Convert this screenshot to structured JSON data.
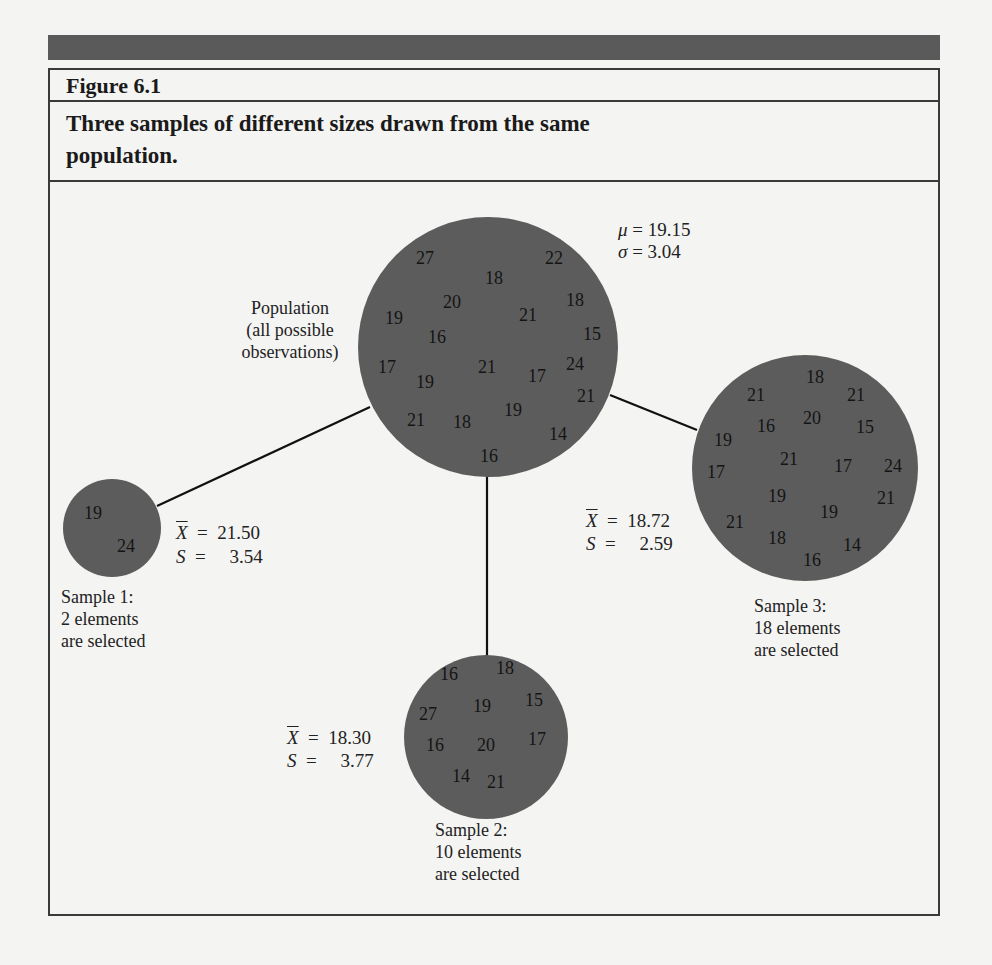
{
  "figure": {
    "label": "Figure 6.1",
    "caption": "Three samples of different sizes drawn from the same population."
  },
  "colors": {
    "circle_fill": "#5c5c5c",
    "header_bar": "#5a5a5a",
    "border": "#3a3a3a"
  },
  "population": {
    "label_lines": [
      "Population",
      "(all possible",
      "observations)"
    ],
    "mu_symbol": "μ",
    "mu_value": "19.15",
    "sigma_symbol": "σ",
    "sigma_value": "3.04",
    "values": [
      "27",
      "18",
      "22",
      "20",
      "21",
      "18",
      "19",
      "16",
      "15",
      "17",
      "19",
      "21",
      "17",
      "24",
      "21",
      "21",
      "18",
      "19",
      "14",
      "16"
    ]
  },
  "samples": [
    {
      "name": "Sample 1:",
      "line2": "2 elements",
      "line3": "are selected",
      "xbar_symbol": "X",
      "xbar_value": "21.50",
      "s_symbol": "S",
      "s_value": "3.54",
      "values": [
        "19",
        "24"
      ]
    },
    {
      "name": "Sample 2:",
      "line2": "10 elements",
      "line3": "are selected",
      "xbar_symbol": "X",
      "xbar_value": "18.30",
      "s_symbol": "S",
      "s_value": "3.77",
      "values": [
        "16",
        "18",
        "27",
        "19",
        "15",
        "16",
        "20",
        "17",
        "14",
        "21"
      ]
    },
    {
      "name": "Sample 3:",
      "line2": "18 elements",
      "line3": "are selected",
      "xbar_symbol": "X",
      "xbar_value": "18.72",
      "s_symbol": "S",
      "s_value": "2.59",
      "values": [
        "18",
        "21",
        "21",
        "16",
        "20",
        "15",
        "19",
        "21",
        "17",
        "17",
        "24",
        "19",
        "21",
        "21",
        "19",
        "18",
        "14",
        "16"
      ]
    }
  ],
  "equals": "="
}
